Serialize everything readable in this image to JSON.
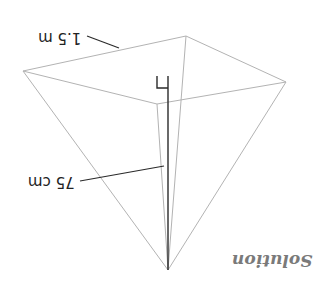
{
  "diagram": {
    "title": "Solution",
    "orientation": "rotated 180 degrees",
    "shape": "square pyramid (inverted view)",
    "labels": {
      "base_edge": "1.5 m",
      "height": "75 cm"
    },
    "colors": {
      "edges": "#b3b3b3",
      "height_line": "#2a2a2a",
      "text": "#222222",
      "title": "#7a7a7a"
    },
    "vertices": {
      "left": [
        23,
        71
      ],
      "back": [
        186,
        36
      ],
      "right": [
        286,
        82
      ],
      "front": [
        157,
        104
      ],
      "apex": [
        168,
        270
      ]
    }
  }
}
